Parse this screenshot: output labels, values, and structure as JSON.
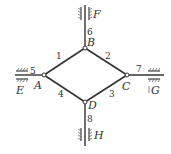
{
  "diagram": {
    "title": "",
    "joints": [
      {
        "id": "A",
        "label": "A",
        "x": 44,
        "y": 75
      },
      {
        "id": "B",
        "label": "B",
        "x": 85,
        "y": 48
      },
      {
        "id": "C",
        "label": "C",
        "x": 127,
        "y": 75
      },
      {
        "id": "D",
        "label": "D",
        "x": 85,
        "y": 102
      }
    ],
    "members": [
      {
        "id": "1",
        "label": "1",
        "from": "A",
        "to": "B"
      },
      {
        "id": "2",
        "label": "2",
        "from": "B",
        "to": "C"
      },
      {
        "id": "3",
        "label": "3",
        "from": "C",
        "to": "D"
      },
      {
        "id": "4",
        "label": "4",
        "from": "D",
        "to": "A"
      },
      {
        "id": "5",
        "label": "5",
        "from": "E",
        "to": "A"
      },
      {
        "id": "6",
        "label": "6",
        "from": "F",
        "to": "B"
      },
      {
        "id": "7",
        "label": "7",
        "from": "C",
        "to": "G"
      },
      {
        "id": "8",
        "label": "8",
        "from": "D",
        "to": "H"
      }
    ],
    "supports": [
      {
        "id": "E",
        "label": "E",
        "type": "horizontal-slider",
        "side": "left"
      },
      {
        "id": "F",
        "label": "F",
        "type": "vertical-slider",
        "side": "top"
      },
      {
        "id": "G",
        "label": "G",
        "type": "horizontal-slider",
        "side": "right"
      },
      {
        "id": "H",
        "label": "H",
        "type": "vertical-slider",
        "side": "bottom"
      }
    ],
    "colors": {
      "line": "#333333",
      "background": "#ffffff"
    }
  }
}
